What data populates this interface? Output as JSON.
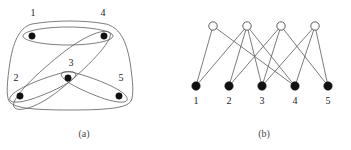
{
  "figure": {
    "type": "hypergraph-and-bipartite-incidence",
    "panels": [
      {
        "id": "a",
        "caption": "(a)",
        "caption_x": 84,
        "caption_y": 137,
        "description": "hypergraph drawn with vertices enclosed by hyperedge curves"
      },
      {
        "id": "b",
        "caption": "(b)",
        "caption_x": 264,
        "caption_y": 137,
        "description": "bipartite incidence graph of the hypergraph"
      }
    ]
  },
  "panel_a": {
    "vertices": [
      {
        "id": "v1",
        "label": "1",
        "cx": 32,
        "cy": 36,
        "r": 3.2,
        "label_x": 33,
        "label_y": 16
      },
      {
        "id": "v2",
        "label": "2",
        "cx": 20,
        "cy": 96,
        "r": 3.2,
        "label_x": 16,
        "label_y": 81
      },
      {
        "id": "v3",
        "label": "3",
        "cx": 68,
        "cy": 78,
        "r": 3.2,
        "label_x": 71,
        "label_y": 66
      },
      {
        "id": "v4",
        "label": "4",
        "cx": 104,
        "cy": 36,
        "r": 3.2,
        "label_x": 103,
        "label_y": 16
      },
      {
        "id": "v5",
        "label": "5",
        "cx": 119,
        "cy": 96,
        "r": 3.2,
        "label_x": 121,
        "label_y": 81
      }
    ],
    "hyperedges": [
      {
        "id": "e-all",
        "members": [
          "1",
          "2",
          "3",
          "4",
          "5"
        ],
        "shape": "outer-blob",
        "path": "M 32 24 C 55 20, 85 20, 106 24 C 118 27, 126 38, 130 62 C 133 82, 134 95, 131 101 C 127 108, 108 110, 70 110 C 32 110, 13 108, 9 101 C 6 95, 7 82, 10 62 C 14 38, 21 27, 32 24 Z"
      },
      {
        "id": "e-14",
        "members": [
          "1",
          "4"
        ],
        "shape": "ellipse-horizontal",
        "path": "M 68 27 C 92 27, 113 31, 113 36 C 113 41, 92 45, 68 45 C 44 45, 23 41, 23 36 C 23 31, 44 27, 68 27 Z"
      },
      {
        "id": "e-23",
        "members": [
          "2",
          "3"
        ],
        "shape": "ellipse-diagonal",
        "path": "M 75 73 C 80 78, 58 90, 32 99 C 16 104, 6 103, 11 96 C 16 89, 40 79, 58 74 C 68 71, 73 71, 75 73 Z"
      },
      {
        "id": "e-35",
        "members": [
          "3",
          "5"
        ],
        "shape": "ellipse-diagonal",
        "path": "M 62 73 C 57 78, 79 90, 105 99 C 121 104, 131 103, 126 96 C 121 89, 97 79, 79 74 C 69 71, 64 71, 62 73 Z"
      },
      {
        "id": "e-42",
        "members": [
          "4",
          "2"
        ],
        "shape": "ellipse-long-diagonal",
        "path": "M 110 33 C 114 38, 94 62, 62 88 C 38 108, 18 113, 14 107 C 10 101, 30 79, 60 55 C 86 34, 106 28, 110 33 Z"
      }
    ]
  },
  "panel_b": {
    "edge_nodes": [
      {
        "id": "E1",
        "cx": 213,
        "cy": 26,
        "r": 4.2
      },
      {
        "id": "E2",
        "cx": 247,
        "cy": 26,
        "r": 4.2
      },
      {
        "id": "E3",
        "cx": 281,
        "cy": 26,
        "r": 4.2
      },
      {
        "id": "E4",
        "cx": 315,
        "cy": 26,
        "r": 4.2
      }
    ],
    "vertex_nodes": [
      {
        "id": "1",
        "label": "1",
        "cx": 196,
        "cy": 86,
        "r": 4.2,
        "label_x": 196,
        "label_y": 104
      },
      {
        "id": "2",
        "label": "2",
        "cx": 229,
        "cy": 86,
        "r": 4.2,
        "label_x": 229,
        "label_y": 104
      },
      {
        "id": "3",
        "label": "3",
        "cx": 262,
        "cy": 86,
        "r": 4.2,
        "label_x": 262,
        "label_y": 104
      },
      {
        "id": "4",
        "label": "4",
        "cx": 295,
        "cy": 86,
        "r": 4.2,
        "label_x": 295,
        "label_y": 104
      },
      {
        "id": "5",
        "label": "5",
        "cx": 328,
        "cy": 86,
        "r": 4.2,
        "label_x": 328,
        "label_y": 104
      }
    ],
    "incidences": [
      {
        "from": "E1",
        "to": "1"
      },
      {
        "from": "E1",
        "to": "4"
      },
      {
        "from": "E2",
        "to": "1"
      },
      {
        "from": "E2",
        "to": "2"
      },
      {
        "from": "E2",
        "to": "3"
      },
      {
        "from": "E2",
        "to": "4"
      },
      {
        "from": "E3",
        "to": "2"
      },
      {
        "from": "E3",
        "to": "3"
      },
      {
        "from": "E3",
        "to": "5"
      },
      {
        "from": "E4",
        "to": "3"
      },
      {
        "from": "E4",
        "to": "4"
      },
      {
        "from": "E4",
        "to": "5"
      }
    ]
  },
  "colors": {
    "stroke": "#5a5a5a",
    "vertex_fill": "#111111",
    "hollow_fill": "#ffffff",
    "label": "#1c1c1c",
    "caption": "#4a4a4a",
    "background": "#ffffff"
  }
}
